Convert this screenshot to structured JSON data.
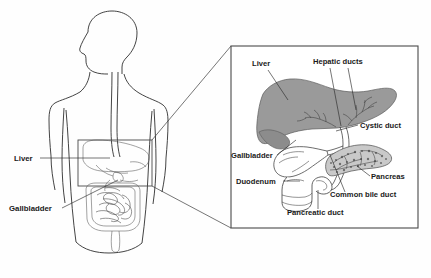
{
  "figure": {
    "background_color": "#fefefe",
    "width": 431,
    "height": 278
  },
  "colors": {
    "liver_fill": "#9a9a9a",
    "liver_fill_dark": "#8c8c8c",
    "pancreas_fill": "#c9c9c9",
    "outline": "#2b2b2b",
    "body_outline": "#2f2f2f",
    "box_outline": "#4a4a4a",
    "text": "#1a1a1a",
    "organ_line": "#555555"
  },
  "body_panel": {
    "name": "human-torso-diagram",
    "labels": [
      {
        "id": "liver",
        "text": "Liver",
        "x": 14,
        "y": 161
      },
      {
        "id": "gallbladder",
        "text": "Gallbladder",
        "x": 9,
        "y": 211
      }
    ],
    "highlight_box": {
      "x": 78,
      "y": 140,
      "width": 74,
      "height": 46
    }
  },
  "inset_panel": {
    "name": "magnified-biliary-inset",
    "box": {
      "x": 231,
      "y": 46,
      "width": 187,
      "height": 182
    },
    "labels": [
      {
        "id": "liver",
        "text": "Liver",
        "x": 252,
        "y": 66
      },
      {
        "id": "hepatic-ducts",
        "text": "Hepatic ducts",
        "x": 313,
        "y": 64
      },
      {
        "id": "cystic-duct",
        "text": "Cystic duct",
        "x": 360,
        "y": 128
      },
      {
        "id": "gallbladder",
        "text": "Gallbladder",
        "x": 231,
        "y": 158
      },
      {
        "id": "pancreas",
        "text": "Pancreas",
        "x": 371,
        "y": 179
      },
      {
        "id": "duodenum",
        "text": "Duodenum",
        "x": 236,
        "y": 184
      },
      {
        "id": "common-bile-duct",
        "text": "Common bile duct",
        "x": 330,
        "y": 197
      },
      {
        "id": "pancreatic-duct",
        "text": "Pancreatic duct",
        "x": 287,
        "y": 215
      }
    ]
  }
}
